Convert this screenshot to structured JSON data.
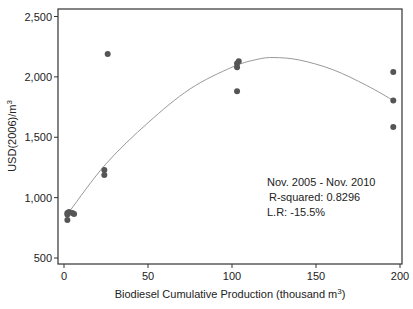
{
  "chart_data": {
    "type": "scatter",
    "title": "",
    "xlabel": "Biodiesel Cumulative Production (thousand m",
    "xlabel_sup": "3",
    "xlabel_end": ")",
    "ylabel": "USD(2006)/m",
    "ylabel_sup": "3",
    "xlim": [
      -3,
      203
    ],
    "ylim": [
      450,
      2560
    ],
    "x_ticks": [
      0,
      50,
      100,
      150,
      200
    ],
    "x_tick_labels": [
      "0",
      "50",
      "100",
      "150",
      "200"
    ],
    "y_ticks": [
      500,
      1000,
      1500,
      2000,
      2500
    ],
    "y_tick_labels": [
      "500",
      "1,000",
      "1,500",
      "2,000",
      "2,500"
    ],
    "grid": false,
    "series": [
      {
        "name": "Observed prices",
        "kind": "points",
        "color": "#555555",
        "points": [
          {
            "x": 2,
            "y": 873
          },
          {
            "x": 3,
            "y": 880
          },
          {
            "x": 5,
            "y": 873
          },
          {
            "x": 6,
            "y": 864
          },
          {
            "x": 2,
            "y": 815
          },
          {
            "x": 2,
            "y": 860
          },
          {
            "x": 24,
            "y": 1229
          },
          {
            "x": 24,
            "y": 1188
          },
          {
            "x": 26,
            "y": 2190
          },
          {
            "x": 104,
            "y": 2130
          },
          {
            "x": 103,
            "y": 2110
          },
          {
            "x": 103,
            "y": 2080
          },
          {
            "x": 103,
            "y": 1880
          },
          {
            "x": 196,
            "y": 2040
          },
          {
            "x": 196,
            "y": 1805
          },
          {
            "x": 196,
            "y": 1585
          }
        ]
      },
      {
        "name": "Quadratic fit",
        "kind": "line",
        "color": "#999999",
        "points": [
          {
            "x": 4,
            "y": 900
          },
          {
            "x": 25,
            "y": 1280
          },
          {
            "x": 50,
            "y": 1620
          },
          {
            "x": 75,
            "y": 1900
          },
          {
            "x": 100,
            "y": 2080
          },
          {
            "x": 115,
            "y": 2145
          },
          {
            "x": 125,
            "y": 2160
          },
          {
            "x": 140,
            "y": 2140
          },
          {
            "x": 160,
            "y": 2060
          },
          {
            "x": 180,
            "y": 1930
          },
          {
            "x": 196,
            "y": 1805
          }
        ]
      }
    ],
    "annotations": [
      "Nov. 2005 - Nov. 2010",
      "R-squared: 0.8296",
      "L.R: -15.5%"
    ],
    "legend": null
  }
}
